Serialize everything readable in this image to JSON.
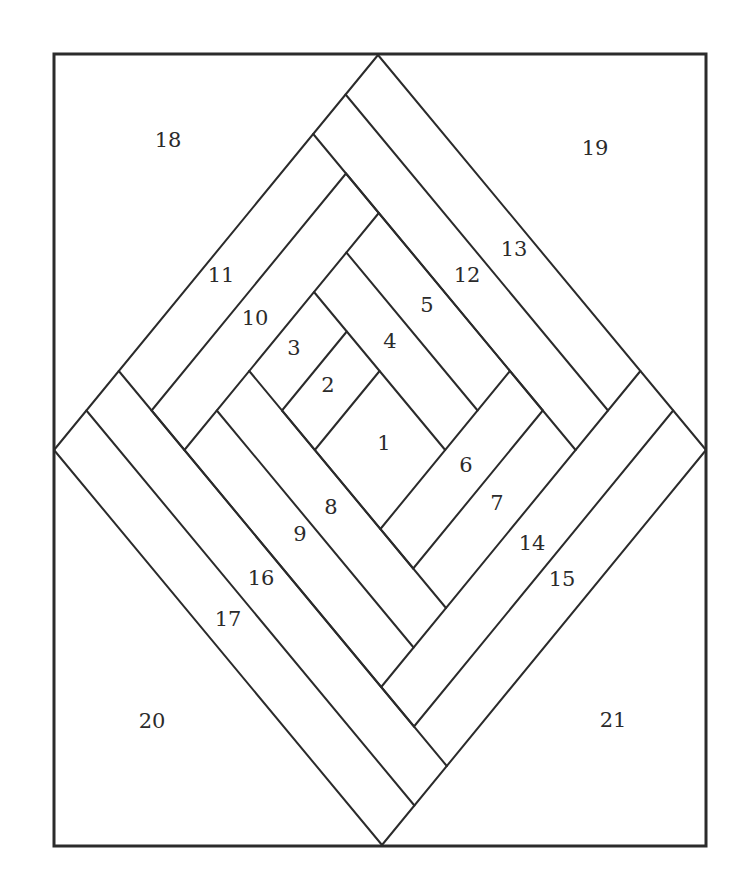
{
  "diagram": {
    "type": "log-cabin quilt block pattern",
    "frame": {
      "x": 54,
      "y": 54,
      "width": 652,
      "height": 792
    },
    "colors": {
      "line": "#2b2b2b",
      "background": "#ffffff"
    },
    "lattice": {
      "origin_x": 378,
      "origin_y": 55,
      "step_x": 32.6,
      "step_y": 39.5,
      "skew_x_per_row": 0.2
    },
    "seams": [
      [
        0,
        0,
        -10,
        10
      ],
      [
        -1,
        3,
        -7,
        9
      ],
      [
        0,
        4,
        -6,
        10
      ],
      [
        -1,
        7,
        -3,
        9
      ],
      [
        0,
        8,
        -2,
        10
      ],
      [
        4,
        8,
        0,
        12
      ],
      [
        5,
        9,
        1,
        13
      ],
      [
        8,
        8,
        0,
        16
      ],
      [
        9,
        9,
        1,
        17
      ],
      [
        10,
        10,
        0,
        20
      ],
      [
        0,
        0,
        10,
        10
      ],
      [
        -1,
        1,
        7,
        9
      ],
      [
        -2,
        2,
        6,
        10
      ],
      [
        -1,
        3,
        5,
        9
      ],
      [
        -1,
        5,
        3,
        9
      ],
      [
        -2,
        6,
        2,
        10
      ],
      [
        -4,
        8,
        1,
        13
      ],
      [
        -3,
        9,
        2,
        14
      ],
      [
        -5,
        9,
        1,
        15
      ],
      [
        -7,
        9,
        1,
        17
      ],
      [
        -8,
        8,
        2,
        18
      ],
      [
        -9,
        9,
        1,
        19
      ],
      [
        -10,
        10,
        0,
        20
      ]
    ],
    "pieces": [
      {
        "label": "1",
        "x": 384,
        "y": 450
      },
      {
        "label": "2",
        "x": 328,
        "y": 392
      },
      {
        "label": "3",
        "x": 294,
        "y": 355
      },
      {
        "label": "4",
        "x": 390,
        "y": 348
      },
      {
        "label": "5",
        "x": 427,
        "y": 312
      },
      {
        "label": "6",
        "x": 466,
        "y": 472
      },
      {
        "label": "7",
        "x": 497,
        "y": 510
      },
      {
        "label": "8",
        "x": 331,
        "y": 514
      },
      {
        "label": "9",
        "x": 300,
        "y": 541
      },
      {
        "label": "10",
        "x": 255,
        "y": 325
      },
      {
        "label": "11",
        "x": 221,
        "y": 282
      },
      {
        "label": "12",
        "x": 467,
        "y": 282
      },
      {
        "label": "13",
        "x": 514,
        "y": 256
      },
      {
        "label": "14",
        "x": 532,
        "y": 550
      },
      {
        "label": "15",
        "x": 562,
        "y": 586
      },
      {
        "label": "16",
        "x": 261,
        "y": 585
      },
      {
        "label": "17",
        "x": 228,
        "y": 626
      },
      {
        "label": "18",
        "x": 168,
        "y": 147
      },
      {
        "label": "19",
        "x": 595,
        "y": 155
      },
      {
        "label": "20",
        "x": 152,
        "y": 728
      },
      {
        "label": "21",
        "x": 613,
        "y": 727
      }
    ]
  }
}
